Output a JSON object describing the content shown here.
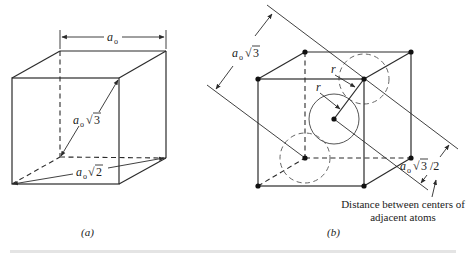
{
  "figure": {
    "panel_a": {
      "label": "(a)",
      "edge_label": {
        "base": "a",
        "sub": "o"
      },
      "body_diagonal_label": {
        "base": "a",
        "sub": "o",
        "radical": "√",
        "radicand": "3"
      },
      "face_diagonal_label": {
        "base": "a",
        "sub": "o",
        "radical": "√",
        "radicand": "2"
      }
    },
    "panel_b": {
      "label": "(b)",
      "body_diagonal_label": {
        "base": "a",
        "sub": "o",
        "radical": "√",
        "radicand": "3"
      },
      "half_diagonal_label": {
        "base": "a",
        "sub": "o",
        "radical": "√",
        "radicand": "3",
        "suffix": "/2"
      },
      "radius_label_1": "r",
      "radius_label_2": "r",
      "annotation_line1": "Distance between centers of",
      "annotation_line2": "adjacent atoms"
    },
    "caption_partial": "Figure ... (cut off)"
  },
  "colors": {
    "line": "#2b2b2b",
    "background": "#ffffff"
  }
}
